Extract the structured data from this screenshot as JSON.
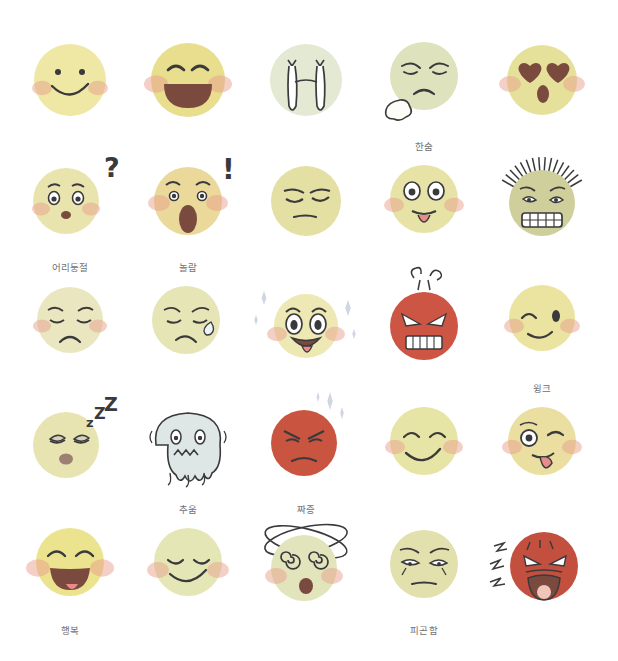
{
  "canvas": {
    "width": 618,
    "height": 661,
    "background": "#ffffff"
  },
  "sheet": {
    "title": "Hand-drawn emoji expression sheet",
    "columns": 5,
    "rows": 5,
    "label_color": "#6f6f72"
  },
  "palette": {
    "yellow_light": "#f2e7a8",
    "yellow": "#ece08f",
    "yellow_warm": "#ecd98a",
    "olive": "#dcd79a",
    "green_pale": "#dfe5b8",
    "blue_pale": "#cfdbe2",
    "red": "#cd5543",
    "red_dark": "#c2503f",
    "blush": "#e7a08d",
    "ink": "#3a3a3c",
    "mouth_dark": "#7a4a3e",
    "tongue": "#e88b8b"
  },
  "faces": [
    {
      "id": "smile",
      "row": 0,
      "col": 0,
      "name": "smiling-face",
      "label": "",
      "body": "#efe7a4",
      "emotion": "smile"
    },
    {
      "id": "laugh",
      "row": 0,
      "col": 1,
      "name": "laughing-open-mouth-face",
      "label": "",
      "body": "#e9dd8e",
      "emotion": "laughing"
    },
    {
      "id": "sob",
      "row": 0,
      "col": 2,
      "name": "crying-waterfall-face",
      "label": "",
      "body": "#e3e9d2",
      "emotion": "crying"
    },
    {
      "id": "sigh",
      "row": 0,
      "col": 3,
      "name": "sighing-face",
      "label": "한숨",
      "body": "#dfe3bd",
      "emotion": "sigh"
    },
    {
      "id": "hearteyes",
      "row": 0,
      "col": 4,
      "name": "heart-eyes-face",
      "label": "",
      "body": "#e6e19a",
      "emotion": "in-love"
    },
    {
      "id": "confused",
      "row": 1,
      "col": 0,
      "name": "confused-face",
      "label": "어리둥절",
      "body": "#e9e4ad",
      "emotion": "confused",
      "mark": "?"
    },
    {
      "id": "shocked",
      "row": 1,
      "col": 1,
      "name": "shocked-face",
      "label": "놀람",
      "body": "#ead99a",
      "emotion": "shocked",
      "mark": "!"
    },
    {
      "id": "bored",
      "row": 1,
      "col": 2,
      "name": "bored-face",
      "label": "",
      "body": "#e4dfa2",
      "emotion": "bored"
    },
    {
      "id": "tongueout",
      "row": 1,
      "col": 3,
      "name": "tongue-out-face",
      "label": "",
      "body": "#e7e3a6",
      "emotion": "playful"
    },
    {
      "id": "stressed",
      "row": 1,
      "col": 4,
      "name": "stressed-spiky-hair-face",
      "label": "",
      "body": "#cfcf9b",
      "emotion": "stressed"
    },
    {
      "id": "sad",
      "row": 2,
      "col": 0,
      "name": "sad-face",
      "label": "",
      "body": "#eae7c0",
      "emotion": "sad"
    },
    {
      "id": "nervous",
      "row": 2,
      "col": 1,
      "name": "nervous-sweat-face",
      "label": "",
      "body": "#e6e5b6",
      "emotion": "nervous"
    },
    {
      "id": "excited",
      "row": 2,
      "col": 2,
      "name": "excited-sparkle-face",
      "label": "",
      "body": "#eee8b4",
      "emotion": "excited"
    },
    {
      "id": "angry",
      "row": 2,
      "col": 3,
      "name": "angry-steaming-face",
      "label": "",
      "body": "#cd5543",
      "emotion": "angry"
    },
    {
      "id": "wink",
      "row": 2,
      "col": 4,
      "name": "winking-face",
      "label": "윙크",
      "body": "#ebe3a0",
      "emotion": "wink"
    },
    {
      "id": "sleepy",
      "row": 3,
      "col": 0,
      "name": "sleeping-face",
      "label": "",
      "body": "#e7e4b2",
      "emotion": "sleepy",
      "mark": "zZZ"
    },
    {
      "id": "cold",
      "row": 3,
      "col": 1,
      "name": "freezing-melting-face",
      "label": "추움",
      "body": "#dfe7e6",
      "emotion": "cold"
    },
    {
      "id": "annoyed",
      "row": 3,
      "col": 2,
      "name": "annoyed-face",
      "label": "짜증",
      "body": "#c9543f",
      "emotion": "annoyed"
    },
    {
      "id": "content",
      "row": 3,
      "col": 3,
      "name": "content-smiling-face",
      "label": "",
      "body": "#e6e5a6",
      "emotion": "content"
    },
    {
      "id": "silly",
      "row": 3,
      "col": 4,
      "name": "silly-wide-eye-face",
      "label": "",
      "body": "#eadfa0",
      "emotion": "silly"
    },
    {
      "id": "joy",
      "row": 4,
      "col": 0,
      "name": "joyful-face",
      "label": "행복",
      "body": "#ece38f",
      "emotion": "joy"
    },
    {
      "id": "calm",
      "row": 4,
      "col": 1,
      "name": "calm-closed-eyes-face",
      "label": "",
      "body": "#e5e6b6",
      "emotion": "calm"
    },
    {
      "id": "dizzy",
      "row": 4,
      "col": 2,
      "name": "dizzy-spiral-eyes-face",
      "label": "",
      "body": "#e2e4bb",
      "emotion": "dizzy"
    },
    {
      "id": "tired",
      "row": 4,
      "col": 3,
      "name": "tired-face",
      "label": "피곤함",
      "body": "#e2e1ad",
      "emotion": "tired"
    },
    {
      "id": "shouting",
      "row": 4,
      "col": 4,
      "name": "shouting-angry-face",
      "label": "",
      "body": "#c3503f",
      "emotion": "shouting"
    }
  ]
}
